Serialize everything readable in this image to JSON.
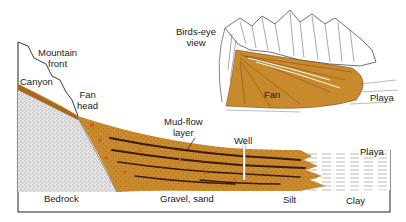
{
  "diagram": {
    "type": "geologic-cross-section",
    "colors": {
      "fan_sediment": "#c98a2e",
      "fan_sediment_dark": "#a8691c",
      "mud_flow_layer": "#3a1a08",
      "bedrock_stipple": "#d9d9d9",
      "playa_lines": "#8a8a8a",
      "outline": "#222222",
      "well": "#ffffff"
    },
    "cross_section": {
      "labels": {
        "mountain_front": [
          "Mountain",
          "front"
        ],
        "canyon": "Canyon",
        "fan_head": [
          "Fan",
          "head"
        ],
        "mud_flow_layer": [
          "Mud-flow",
          "layer"
        ],
        "well": "Well",
        "playa": "Playa",
        "bedrock": "Bedrock",
        "gravel_sand": "Gravel, sand",
        "silt": "Silt",
        "clay": "Clay"
      }
    },
    "inset": {
      "title": [
        "Birds-eye",
        "view"
      ],
      "labels": {
        "fan": "Fan",
        "playa": "Playa"
      }
    }
  }
}
